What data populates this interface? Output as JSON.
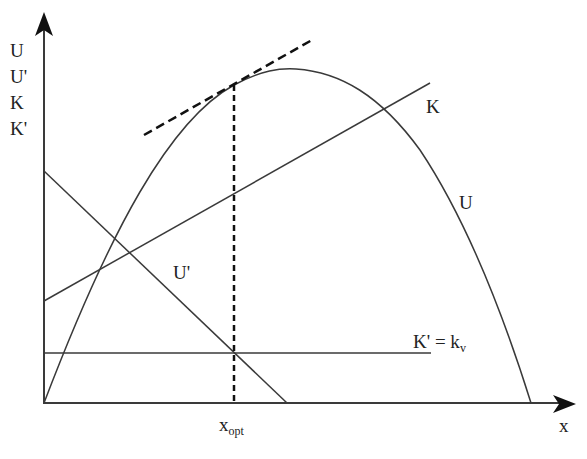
{
  "diagram": {
    "title": "",
    "colors": {
      "line": "#3a3a3a",
      "text": "#222222",
      "background": "#ffffff"
    },
    "y_axis_labels": [
      "U",
      "U'",
      "K",
      "K'"
    ],
    "x_axis_label": "x",
    "curves": {
      "U": {
        "label": "U",
        "type": "concave curve",
        "from": [
          44,
          403
        ],
        "peak": [
          290,
          70
        ],
        "to": [
          531,
          403
        ]
      },
      "U_prime": {
        "label": "U'",
        "type": "line",
        "from": [
          44,
          171
        ],
        "to": [
          287,
          403
        ]
      },
      "K": {
        "label": "K",
        "type": "line",
        "from": [
          44,
          301
        ],
        "to": [
          430,
          83
        ]
      },
      "K_prime": {
        "label_main": "K' = k",
        "label_sub": "v",
        "type": "horizontal line",
        "y": 353,
        "from_x": 44,
        "to_x": 431
      }
    },
    "tangent": {
      "style": "dashed",
      "from": [
        144,
        135
      ],
      "to": [
        312,
        40
      ],
      "touch_point": [
        234,
        85
      ]
    },
    "optimum": {
      "label_main": "x",
      "label_sub": "opt",
      "x": 234,
      "style": "dashed vertical"
    }
  }
}
